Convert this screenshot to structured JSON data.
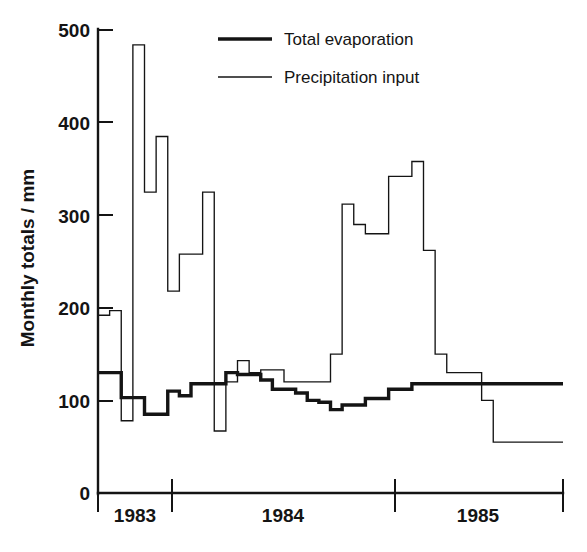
{
  "chart_data": {
    "type": "line",
    "subtype": "step-histogram",
    "title": "",
    "xlabel": "",
    "ylabel": "Monthly totals / mm",
    "ylim": [
      0,
      500
    ],
    "yticks": [
      0,
      100,
      200,
      300,
      400,
      500
    ],
    "ytick_labels": [
      "0",
      "100",
      "200",
      "300",
      "400",
      "500"
    ],
    "grid": false,
    "legend_position": "top-right",
    "x_axis_type": "time",
    "x_category_ticks": [
      "1983",
      "1984",
      "1985"
    ],
    "x_tick_positions_months": [
      0,
      4,
      16,
      28,
      39
    ],
    "x_range_months": [
      0,
      39
    ],
    "series": [
      {
        "name": "Total evaporation",
        "line_style": "thick",
        "color": "#141414",
        "values": [
          130,
          130,
          103,
          103,
          85,
          85,
          110,
          105,
          118,
          118,
          118,
          130,
          128,
          128,
          122,
          112,
          112,
          108,
          100,
          98,
          90,
          95,
          95,
          102,
          102,
          112,
          112,
          118,
          118,
          118,
          118,
          118,
          118,
          118,
          118,
          118,
          118,
          118,
          118,
          118
        ]
      },
      {
        "name": "Precipitation input",
        "line_style": "thin",
        "color": "#141414",
        "values": [
          192,
          197,
          78,
          484,
          325,
          385,
          218,
          258,
          258,
          325,
          67,
          120,
          143,
          130,
          133,
          133,
          120,
          120,
          120,
          120,
          150,
          312,
          290,
          280,
          280,
          342,
          342,
          358,
          262,
          150,
          130,
          130,
          130,
          100,
          55,
          55,
          55,
          55,
          55,
          55
        ]
      }
    ],
    "legend_entries": [
      {
        "label": "Total evaporation",
        "style": "thick"
      },
      {
        "label": "Precipitation input",
        "style": "thin"
      }
    ]
  },
  "axis": {
    "y_title": "Monthly totals / mm",
    "y_ticks": [
      "500",
      "400",
      "300",
      "200",
      "100",
      "0"
    ],
    "x_year_labels": [
      "1983",
      "1984",
      "1985"
    ]
  },
  "legend": {
    "entry_1": "Total evaporation",
    "entry_2": "Precipitation input"
  }
}
